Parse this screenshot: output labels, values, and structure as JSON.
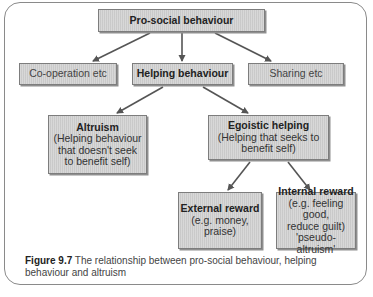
{
  "diagram": {
    "root": {
      "title": "Pro-social behaviour"
    },
    "level2": [
      {
        "title": "Co-operation etc",
        "bold": false
      },
      {
        "title": "Helping behaviour",
        "bold": true
      },
      {
        "title": "Sharing etc",
        "bold": false
      }
    ],
    "level3": [
      {
        "title": "Altruism",
        "lines": [
          "(Helping behaviour",
          "that doesn't seek",
          "to benefit self)"
        ]
      },
      {
        "title": "Egoistic helping",
        "lines": [
          "(Helping that seeks to",
          "benefit self)"
        ]
      }
    ],
    "level4": [
      {
        "title": "External reward",
        "lines": [
          "(e.g. money,",
          "praise)"
        ]
      },
      {
        "title": "Internal reward",
        "lines": [
          "(e.g. feeling good,",
          "reduce guilt)",
          "'pseudo-altruism'"
        ]
      }
    ],
    "edges": [
      [
        "Pro-social behaviour",
        "Co-operation etc"
      ],
      [
        "Pro-social behaviour",
        "Helping behaviour"
      ],
      [
        "Pro-social behaviour",
        "Sharing etc"
      ],
      [
        "Helping behaviour",
        "Altruism"
      ],
      [
        "Helping behaviour",
        "Egoistic helping"
      ],
      [
        "Egoistic helping",
        "External reward"
      ],
      [
        "Egoistic helping",
        "Internal reward"
      ]
    ],
    "colors": {
      "box_fill": "#d0d0d0",
      "box_border": "#7d7d7d",
      "arrow": "#555555",
      "frame": "#8a8a8a"
    }
  },
  "caption": {
    "label": "Figure 9.7",
    "text": "The relationship between pro-social behaviour, helping behaviour and altruism"
  }
}
